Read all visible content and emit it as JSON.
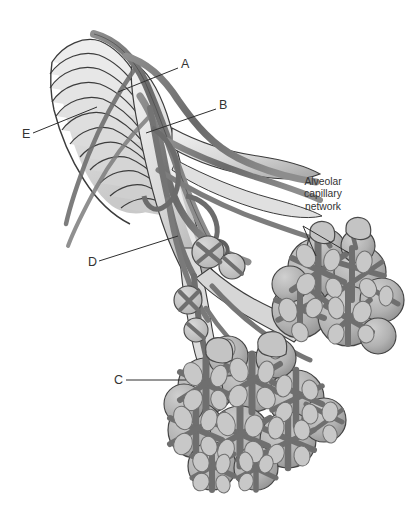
{
  "figure": {
    "kind": "anatomical-illustration",
    "style": "grayscale medical line drawing",
    "background_color": "#ffffff",
    "ink_color": "#333333",
    "palette": {
      "cartilage_light": "#eeeeee",
      "cartilage_mid": "#d5d5d5",
      "cartilage_shadow": "#b4b4b4",
      "vessel_dark": "#6e6e6e",
      "vessel_mid": "#8a8a8a",
      "alveoli_fill": "#aeaeae",
      "alveoli_light": "#c6c6c6",
      "outline": "#3c3c3c"
    }
  },
  "labels": [
    {
      "id": "A",
      "text": "A",
      "x": 181,
      "y": 58,
      "leader": {
        "x1": 178,
        "y1": 68,
        "x2": 118,
        "y2": 92
      }
    },
    {
      "id": "B",
      "text": "B",
      "x": 219,
      "y": 99,
      "leader": {
        "x1": 216,
        "y1": 109,
        "x2": 146,
        "y2": 133
      }
    },
    {
      "id": "E",
      "text": "E",
      "x": 22,
      "y": 128,
      "leader": {
        "x1": 33,
        "y1": 133,
        "x2": 97,
        "y2": 107
      }
    },
    {
      "id": "D",
      "text": "D",
      "x": 88,
      "y": 256,
      "leader": {
        "x1": 99,
        "y1": 261,
        "x2": 178,
        "y2": 236
      }
    },
    {
      "id": "C",
      "text": "C",
      "x": 114,
      "y": 374,
      "leader": {
        "x1": 126,
        "y1": 380,
        "x2": 186,
        "y2": 380
      }
    }
  ],
  "callout": {
    "lines": [
      "Alveolar",
      "capillary",
      "network"
    ],
    "text": "Alveolar capillary network",
    "x": 286,
    "y": 176,
    "leaders": [
      {
        "x1": 303,
        "y1": 226,
        "x2": 316,
        "y2": 256
      },
      {
        "x1": 303,
        "y1": 226,
        "x2": 349,
        "y2": 253
      }
    ]
  },
  "structures": [
    {
      "name": "trachea-cartilage-rings",
      "count": 12,
      "label_ref": "E"
    },
    {
      "name": "pulmonary-vessel-upper",
      "label_ref": "A"
    },
    {
      "name": "bronchial-branch",
      "label_ref": "B"
    },
    {
      "name": "main-bronchus-trunk",
      "label_ref": "D"
    },
    {
      "name": "alveolar-sac-cluster",
      "label_ref": "C"
    },
    {
      "name": "alveolar-capillary-mesh",
      "label_ref": "callout"
    }
  ],
  "alveoli_clusters": [
    {
      "name": "upper-right-cluster",
      "cx": 330,
      "cy": 290,
      "r": 58
    },
    {
      "name": "lower-center-cluster",
      "cx": 235,
      "cy": 415,
      "r": 70
    }
  ]
}
